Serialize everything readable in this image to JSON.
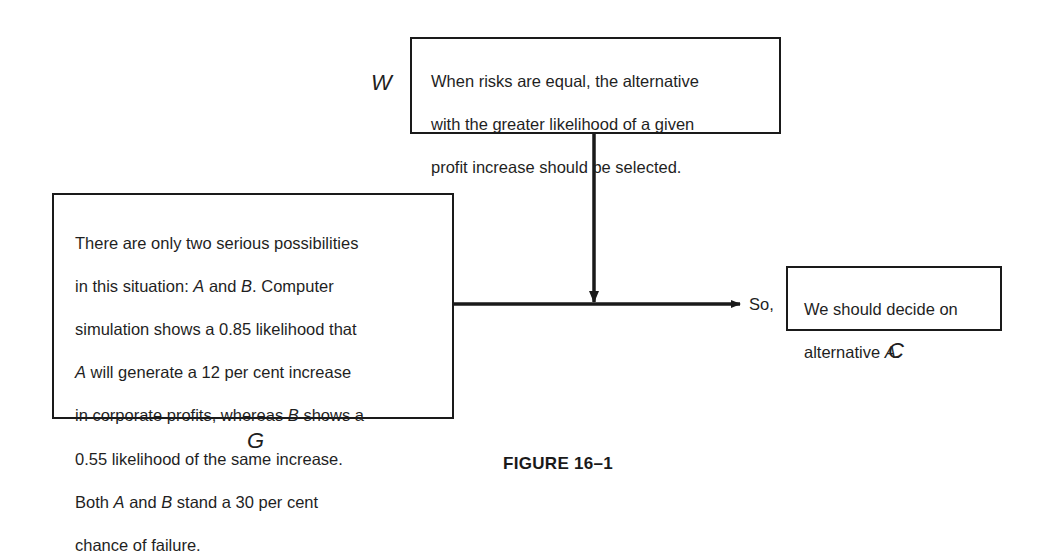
{
  "warrant": {
    "label": "W",
    "lines": [
      "When risks are equal, the alternative",
      "with the greater likelihood of a given",
      "profit increase should be selected."
    ]
  },
  "grounds": {
    "label": "G",
    "lines": [
      "There are only two serious possibilities",
      "in this situation: A and B. Computer",
      "simulation shows a 0.85 likelihood that",
      "A will generate a 12 per cent increase",
      "in corporate profits, whereas B shows a",
      "0.55 likelihood of the same increase.",
      "Both A and B stand a 30 per cent",
      "chance of failure."
    ]
  },
  "claim": {
    "label": "C",
    "connector": "So,",
    "lines": [
      "We should decide on",
      "alternative A."
    ]
  },
  "caption": "FIGURE 16–1"
}
